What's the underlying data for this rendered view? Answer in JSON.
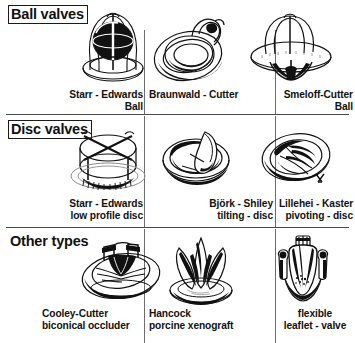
{
  "figure": {
    "ink_color": "#111111",
    "rule_color": "#4a4a4a",
    "background": "#ffffff"
  },
  "sections": [
    {
      "id": "ball-valves",
      "header": "Ball valves",
      "boxed": true,
      "items": [
        {
          "id": "starr-edwards-ball",
          "line1": "Starr - Edwards",
          "line2": "Ball",
          "align": "right",
          "illustration": "caged-ball-valve"
        },
        {
          "id": "braunwald-cutter",
          "line1": "Braunwald - Cutter",
          "line2": "",
          "align": "left",
          "illustration": "low-profile-ball-valve"
        },
        {
          "id": "smeloff-cutter-ball",
          "line1": "Smeloff-Cutter",
          "line2": "Ball",
          "align": "right",
          "illustration": "open-cage-ball-valve"
        }
      ]
    },
    {
      "id": "disc-valves",
      "header": "Disc valves",
      "boxed": true,
      "items": [
        {
          "id": "starr-edwards-low-profile-disc",
          "line1": "Starr - Edwards",
          "line2": "low profile disc",
          "align": "right",
          "illustration": "caged-disc-valve"
        },
        {
          "id": "bjork-shiley-tilting-disc",
          "line1": "Björk - Shiley",
          "line2": "tilting - disc",
          "align": "right",
          "illustration": "tilting-disc-valve"
        },
        {
          "id": "lillehei-kaster-pivoting-disc",
          "line1": "Lillehei - Kaster",
          "line2": "pivoting - disc",
          "align": "right",
          "illustration": "pivoting-disc-valve"
        }
      ]
    },
    {
      "id": "other-types",
      "header": "Other types",
      "boxed": false,
      "items": [
        {
          "id": "cooley-cutter-biconical-occluder",
          "line1": "Cooley-Cutter",
          "line2": "biconical occluder",
          "align": "left",
          "illustration": "biconical-occluder-valve"
        },
        {
          "id": "hancock-porcine-xenograft",
          "line1": "Hancock",
          "line2": "porcine xenograft",
          "align": "left",
          "illustration": "porcine-xenograft-valve"
        },
        {
          "id": "flexible-leaflet-valve",
          "line1": "flexible",
          "line2": "leaflet - valve",
          "align": "center",
          "illustration": "flexible-leaflet-valve"
        }
      ]
    }
  ]
}
